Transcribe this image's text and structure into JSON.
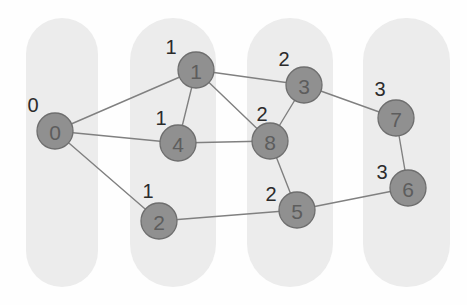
{
  "figure": {
    "width": 467,
    "height": 305,
    "background_color": "#fefefe"
  },
  "colors": {
    "capsule_fill": "#ececec",
    "node_fill": "#909090",
    "node_stroke": "#6e6e6e",
    "node_label_text": "#5d5d5d",
    "edge_stroke": "#808080",
    "color_label_text": "#2b2b2b"
  },
  "chart_data": {
    "type": "diagram",
    "title": "",
    "nodes": [
      {
        "id": "0",
        "label": "0",
        "color_label": "0",
        "cx": 55,
        "cy": 131,
        "r": 18,
        "label_x": 33,
        "label_y": 105,
        "group": 1
      },
      {
        "id": "1",
        "label": "1",
        "color_label": "1",
        "cx": 196,
        "cy": 70,
        "r": 18,
        "label_x": 171,
        "label_y": 47,
        "group": 2
      },
      {
        "id": "4",
        "label": "4",
        "color_label": "1",
        "cx": 178,
        "cy": 143,
        "r": 18,
        "label_x": 161,
        "label_y": 118,
        "group": 2
      },
      {
        "id": "2",
        "label": "2",
        "color_label": "1",
        "cx": 159,
        "cy": 221,
        "r": 18,
        "label_x": 148,
        "label_y": 191,
        "group": 2
      },
      {
        "id": "3",
        "label": "3",
        "color_label": "2",
        "cx": 304,
        "cy": 85,
        "r": 18,
        "label_x": 284,
        "label_y": 59,
        "group": 3
      },
      {
        "id": "8",
        "label": "8",
        "color_label": "2",
        "cx": 270,
        "cy": 141,
        "r": 18,
        "label_x": 262,
        "label_y": 114,
        "group": 3
      },
      {
        "id": "5",
        "label": "5",
        "color_label": "2",
        "cx": 297,
        "cy": 210,
        "r": 18,
        "label_x": 271,
        "label_y": 194,
        "group": 3
      },
      {
        "id": "7",
        "label": "7",
        "color_label": "3",
        "cx": 396,
        "cy": 118,
        "r": 18,
        "label_x": 380,
        "label_y": 89,
        "group": 4
      },
      {
        "id": "6",
        "label": "6",
        "color_label": "3",
        "cx": 408,
        "cy": 188,
        "r": 18,
        "label_x": 382,
        "label_y": 172,
        "group": 4
      }
    ],
    "edges": [
      {
        "source": "0",
        "target": "1"
      },
      {
        "source": "0",
        "target": "4"
      },
      {
        "source": "0",
        "target": "2"
      },
      {
        "source": "1",
        "target": "4"
      },
      {
        "source": "1",
        "target": "8"
      },
      {
        "source": "1",
        "target": "3"
      },
      {
        "source": "4",
        "target": "8"
      },
      {
        "source": "3",
        "target": "8"
      },
      {
        "source": "3",
        "target": "7"
      },
      {
        "source": "8",
        "target": "5"
      },
      {
        "source": "2",
        "target": "5"
      },
      {
        "source": "5",
        "target": "6"
      },
      {
        "source": "7",
        "target": "6"
      }
    ],
    "groups": [
      {
        "id": "group-1",
        "x": 26,
        "y": 18,
        "width": 72,
        "height": 269,
        "radius": 36,
        "color_label": "0"
      },
      {
        "id": "group-2",
        "x": 130,
        "y": 18,
        "width": 86,
        "height": 269,
        "radius": 43,
        "color_label": "1"
      },
      {
        "id": "group-3",
        "x": 247,
        "y": 18,
        "width": 86,
        "height": 269,
        "radius": 43,
        "color_label": "2"
      },
      {
        "id": "group-4",
        "x": 363,
        "y": 18,
        "width": 87,
        "height": 269,
        "radius": 43,
        "color_label": "3"
      }
    ],
    "color_class_count": 4,
    "node_count": 9,
    "edge_count": 13
  }
}
